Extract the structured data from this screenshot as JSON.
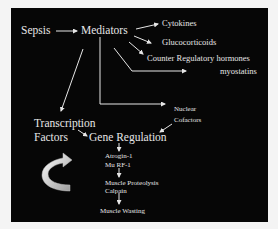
{
  "diagram": {
    "nodes": {
      "sepsis": "Sepsis",
      "mediators": "Mediators",
      "cytokines": "Cytokines",
      "glucocorticoids": "Glucocorticoids",
      "counter_regulatory": "Counter Regulatory hormones",
      "myostatins": "myostatins",
      "transcription": "Transcription",
      "factors": "Factors",
      "gene_regulation": "Gene Regulation",
      "nuclear": "Nuclear",
      "cofactors": "Cofactors",
      "atrogin": "Atrogin-1",
      "murf": "Mu RF-1",
      "proteolysis": "Muscle Proteolysis",
      "calpain": "Calpain",
      "wasting": "Muscle Wasting"
    },
    "icons": {
      "curved_arrow": "curved-arrow-icon"
    },
    "colors": {
      "background": "#060606",
      "text": "#e6e6e6",
      "page": "#f4f4f4"
    }
  }
}
